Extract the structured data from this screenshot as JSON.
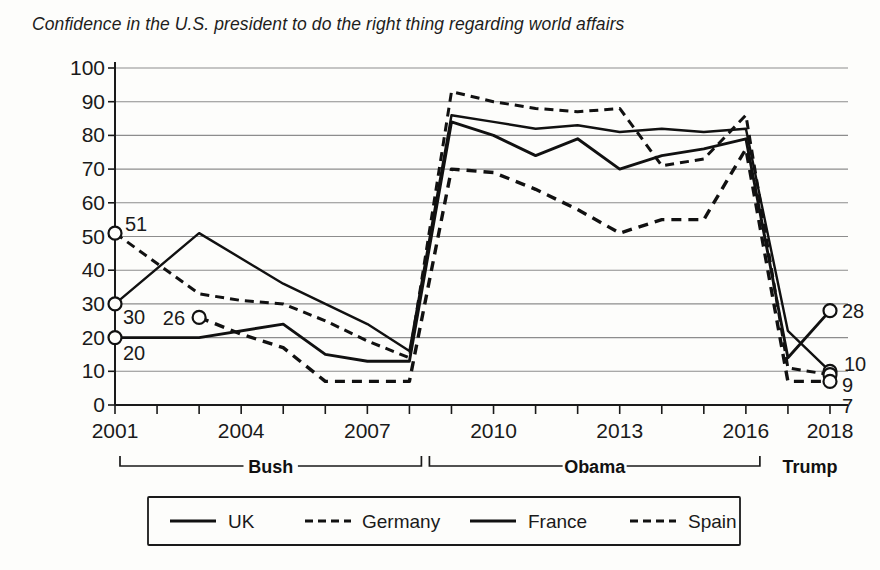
{
  "title": "Confidence in the U.S. president to do the right thing regarding world affairs",
  "axis": {
    "y_ticks": [
      "0",
      "10",
      "20",
      "30",
      "40",
      "50",
      "60",
      "70",
      "80",
      "90",
      "100"
    ],
    "x_ticks": [
      "2001",
      "2004",
      "2007",
      "2010",
      "2013",
      "2016",
      "2018"
    ]
  },
  "eras": [
    {
      "name": "Bush",
      "label": "Bush",
      "start": 2001,
      "end": 2008
    },
    {
      "name": "Obama",
      "label": "Obama",
      "start": 2009,
      "end": 2016
    },
    {
      "name": "Trump",
      "label": "Trump",
      "start": 2017,
      "end": 2018
    }
  ],
  "legend": {
    "items": [
      {
        "label": "UK",
        "style": "solid"
      },
      {
        "label": "Germany",
        "style": "dashed"
      },
      {
        "label": "France",
        "style": "solid"
      },
      {
        "label": "Spain",
        "style": "dashed"
      }
    ]
  },
  "point_labels": {
    "start": [
      {
        "series": "Germany",
        "value": "51"
      },
      {
        "series": "UK",
        "value": "30"
      },
      {
        "series": "France",
        "value": "20"
      },
      {
        "series": "Spain",
        "value": "26"
      }
    ],
    "end": [
      {
        "series": "France",
        "value": "28"
      },
      {
        "series": "UK",
        "value": "10"
      },
      {
        "series": "Germany",
        "value": "9"
      },
      {
        "series": "Spain",
        "value": "7"
      }
    ]
  },
  "chart_data": {
    "type": "line",
    "title": "Confidence in the U.S. president to do the right thing regarding world affairs",
    "xlabel": "",
    "ylabel": "",
    "ylim": [
      0,
      100
    ],
    "xlim": [
      2001,
      2018
    ],
    "grid": true,
    "legend_position": "bottom",
    "x": [
      2001,
      2002,
      2003,
      2004,
      2005,
      2006,
      2007,
      2008,
      2009,
      2010,
      2011,
      2012,
      2013,
      2014,
      2015,
      2016,
      2017,
      2018
    ],
    "series": [
      {
        "name": "UK",
        "style": "solid",
        "x": [
          2001,
          2003,
          2005,
          2006,
          2007,
          2008,
          2009,
          2010,
          2011,
          2012,
          2013,
          2014,
          2015,
          2016,
          2017,
          2018
        ],
        "values": [
          30,
          51,
          36,
          30,
          24,
          16,
          86,
          84,
          82,
          83,
          81,
          82,
          81,
          82,
          22,
          10
        ]
      },
      {
        "name": "Germany",
        "style": "dashed",
        "x": [
          2001,
          2002,
          2003,
          2004,
          2005,
          2006,
          2007,
          2008,
          2009,
          2010,
          2011,
          2012,
          2013,
          2014,
          2015,
          2016,
          2017,
          2018
        ],
        "values": [
          51,
          42,
          33,
          31,
          30,
          25,
          19,
          14,
          93,
          90,
          88,
          87,
          88,
          71,
          73,
          86,
          11,
          9
        ],
        "note": "rendered path follows visible trace: 51,33,31,30,25,19,14 then 92,90,88,87,88,71,73,83 then drop"
      },
      {
        "name": "France",
        "style": "solid",
        "x": [
          2001,
          2003,
          2005,
          2006,
          2007,
          2008,
          2009,
          2010,
          2011,
          2012,
          2013,
          2014,
          2015,
          2016,
          2017,
          2018
        ],
        "values": [
          20,
          20,
          24,
          15,
          13,
          13,
          84,
          80,
          74,
          79,
          70,
          74,
          76,
          79,
          14,
          28
        ]
      },
      {
        "name": "Spain",
        "style": "dashed",
        "x": [
          2003,
          2004,
          2005,
          2006,
          2007,
          2008,
          2009,
          2010,
          2011,
          2012,
          2013,
          2014,
          2015,
          2016,
          2017,
          2018
        ],
        "values": [
          26,
          21,
          17,
          7,
          7,
          7,
          70,
          69,
          64,
          58,
          51,
          55,
          55,
          76,
          7,
          7
        ]
      }
    ],
    "point_labels_start": {
      "Germany": 51,
      "UK": 30,
      "France": 20,
      "Spain": 26
    },
    "point_labels_end": {
      "France": 28,
      "UK": 10,
      "Germany": 9,
      "Spain": 7
    }
  }
}
